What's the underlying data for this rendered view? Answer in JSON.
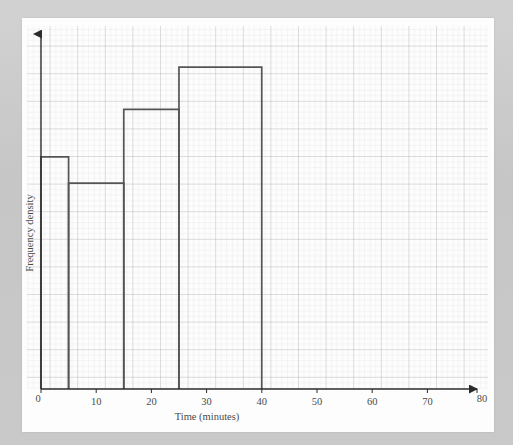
{
  "page": {
    "bleed_text": "",
    "paper_color": "#fdfdfd",
    "border_color": "#c9c9c9",
    "grid_minor_color": "#e4e0e2",
    "grid_major_color": "#bdb9bd",
    "axis_color": "#2b2b2b",
    "bar_color": "#555555"
  },
  "chart_data": {
    "type": "bar",
    "title": "",
    "xlabel": "Time (minutes)",
    "ylabel": "Frequency density",
    "xlim": [
      0,
      80
    ],
    "ylim": [
      0,
      6.5
    ],
    "xticks": [
      0,
      10,
      20,
      30,
      40,
      50,
      60,
      70,
      80
    ],
    "xtick_labels": [
      "0",
      "10",
      "20",
      "30",
      "40",
      "50",
      "60",
      "70",
      "80"
    ],
    "yticks": [],
    "ytick_labels": [],
    "grid": true,
    "grid_minor_step_x": 1,
    "grid_major_step_x": 5,
    "legend": null,
    "bin_edges": [
      0,
      5,
      15,
      25,
      40
    ],
    "categories": [
      "0-5",
      "5-15",
      "15-25",
      "25-40"
    ],
    "values": [
      4.4,
      3.9,
      5.3,
      6.1
    ],
    "bars": [
      {
        "label": "0-5",
        "x0": 0,
        "x1": 5,
        "height": 4.4
      },
      {
        "label": "5-15",
        "x0": 5,
        "x1": 15,
        "height": 3.9
      },
      {
        "label": "15-25",
        "x0": 15,
        "x1": 25,
        "height": 5.3
      },
      {
        "label": "25-40",
        "x0": 25,
        "x1": 40,
        "height": 6.1
      }
    ]
  },
  "axes": {
    "x_arrow": true,
    "y_arrow": true,
    "origin_label": "0"
  }
}
